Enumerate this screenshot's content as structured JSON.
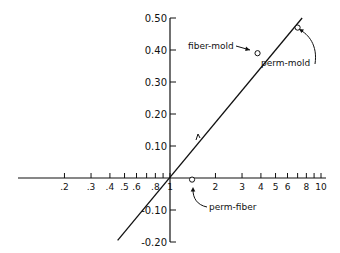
{
  "chart_data": {
    "type": "scatter",
    "title": "",
    "xlabel": "",
    "ylabel": "",
    "xscale": "log",
    "xlim": [
      0.15,
      10
    ],
    "ylim": [
      -0.2,
      0.5
    ],
    "grid": false,
    "x_ticks": [
      {
        "value": 0.2,
        "label": ".2"
      },
      {
        "value": 0.3,
        "label": ".3"
      },
      {
        "value": 0.4,
        "label": ".4"
      },
      {
        "value": 0.5,
        "label": ".5"
      },
      {
        "value": 0.6,
        "label": ".6"
      },
      {
        "value": 0.7,
        "label": ""
      },
      {
        "value": 0.8,
        "label": ".8"
      },
      {
        "value": 0.9,
        "label": ""
      },
      {
        "value": 1,
        "label": "1"
      },
      {
        "value": 2,
        "label": "2"
      },
      {
        "value": 3,
        "label": "3"
      },
      {
        "value": 4,
        "label": "4"
      },
      {
        "value": 5,
        "label": "5"
      },
      {
        "value": 6,
        "label": "6"
      },
      {
        "value": 7,
        "label": ""
      },
      {
        "value": 8,
        "label": "8"
      },
      {
        "value": 9,
        "label": ""
      },
      {
        "value": 10,
        "label": "10"
      }
    ],
    "y_ticks": [
      {
        "value": 0.5,
        "label": "0.50"
      },
      {
        "value": 0.4,
        "label": "0.40"
      },
      {
        "value": 0.3,
        "label": "0.30"
      },
      {
        "value": 0.2,
        "label": "0.20"
      },
      {
        "value": 0.1,
        "label": "0.10"
      },
      {
        "value": -0.1,
        "label": "-0.10"
      },
      {
        "value": -0.2,
        "label": "-0.20"
      }
    ],
    "points": [
      {
        "label": "fiber-mold",
        "x": 3.8,
        "y": 0.39
      },
      {
        "label": "perm-mold",
        "x": 7.0,
        "y": 0.47
      },
      {
        "label": "perm-fiber",
        "x": 1.4,
        "y": -0.005
      }
    ],
    "fit_line": {
      "x_start": 0.45,
      "y_start": -0.195,
      "x_end": 7.5,
      "y_end": 0.5
    }
  }
}
